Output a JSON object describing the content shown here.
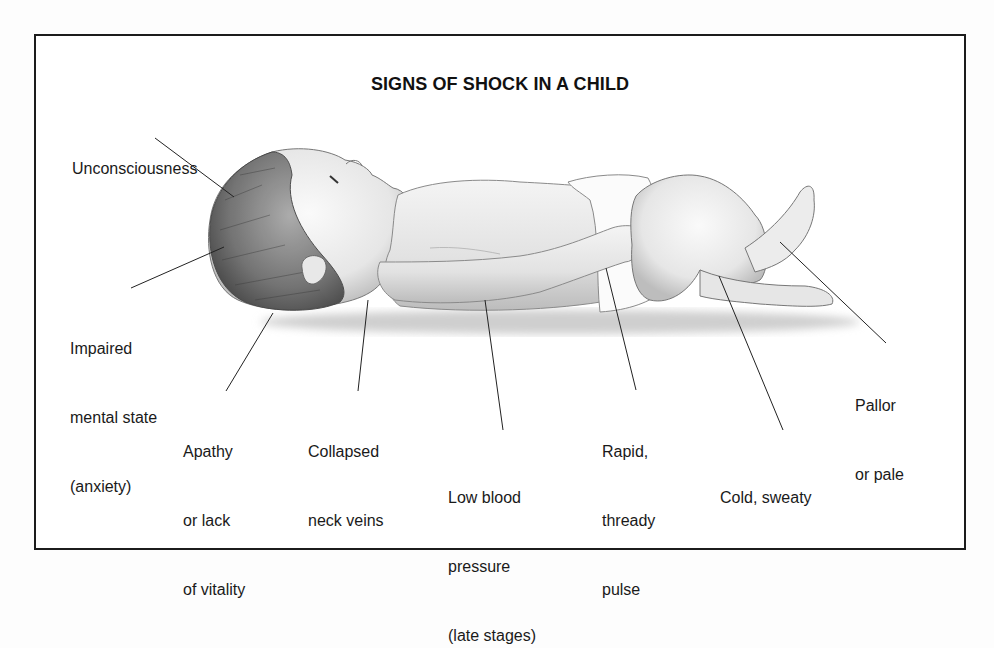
{
  "title": "SIGNS OF SHOCK IN A CHILD",
  "illustration": {
    "subject": "infant lying on back (supine)",
    "icon": "infant-illustration"
  },
  "labels": [
    {
      "id": "unconsciousness",
      "lines": [
        "Unconsciousness"
      ]
    },
    {
      "id": "impaired-mental-state",
      "lines": [
        "Impaired",
        "mental state",
        "(anxiety)"
      ]
    },
    {
      "id": "apathy",
      "lines": [
        "Apathy",
        "or lack",
        "of vitality"
      ]
    },
    {
      "id": "collapsed-neck-veins",
      "lines": [
        "Collapsed",
        "neck veins"
      ]
    },
    {
      "id": "low-blood-pressure",
      "lines": [
        "Low blood",
        "pressure",
        "(late stages)"
      ]
    },
    {
      "id": "rapid-thready-pulse",
      "lines": [
        "Rapid,",
        "thready",
        "pulse"
      ]
    },
    {
      "id": "cold-sweaty",
      "lines": [
        "Cold, sweaty"
      ]
    },
    {
      "id": "pallor",
      "lines": [
        "Pallor",
        "or pale"
      ]
    }
  ],
  "colors": {
    "frame": "#1c1c1c",
    "text": "#1a1a1a",
    "skin_fill": "#efefef",
    "shade": "#c8c8c8",
    "hair": "#6a6a6a"
  }
}
